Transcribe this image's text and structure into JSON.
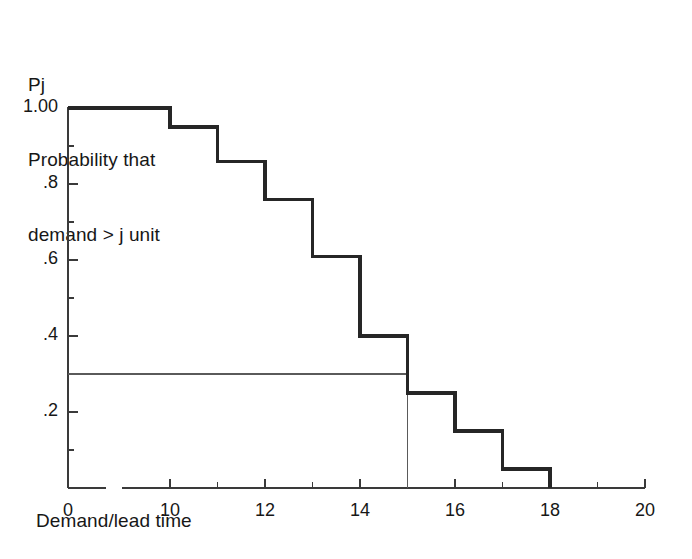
{
  "chart_data": {
    "type": "line",
    "subtype": "step-survival-function",
    "title": "",
    "ylabel": "Pj\nProbability that\ndemand > j unit",
    "ylabel_lines": [
      "Pj",
      "Probability that",
      "demand > j unit"
    ],
    "xlabel": "Demand/lead time",
    "x": [
      0,
      10,
      11,
      12,
      13,
      14,
      15,
      16,
      17,
      18
    ],
    "values": [
      1.0,
      0.95,
      0.86,
      0.76,
      0.61,
      0.4,
      0.25,
      0.15,
      0.05,
      0.0
    ],
    "steps": [
      {
        "x_start": 0,
        "x_end": 10,
        "p": 1.0
      },
      {
        "x_start": 10,
        "x_end": 11,
        "p": 0.95
      },
      {
        "x_start": 11,
        "x_end": 12,
        "p": 0.86
      },
      {
        "x_start": 12,
        "x_end": 13,
        "p": 0.76
      },
      {
        "x_start": 13,
        "x_end": 14,
        "p": 0.61
      },
      {
        "x_start": 14,
        "x_end": 15,
        "p": 0.4
      },
      {
        "x_start": 15,
        "x_end": 16,
        "p": 0.25
      },
      {
        "x_start": 16,
        "x_end": 17,
        "p": 0.15
      },
      {
        "x_start": 17,
        "x_end": 18,
        "p": 0.05
      }
    ],
    "reference_line": {
      "p": 0.3,
      "x_intersect": 15,
      "orientation": "horizontal-then-vertical"
    },
    "xlim": [
      0,
      20
    ],
    "ylim": [
      0,
      1.0
    ],
    "x_axis_break": {
      "after": 0,
      "before": 10
    },
    "xticks": [
      0,
      10,
      12,
      14,
      16,
      18,
      20
    ],
    "xtick_labels": [
      "0",
      "10",
      "12",
      "14",
      "16",
      "18",
      "20"
    ],
    "yticks": [
      1.0,
      0.8,
      0.6,
      0.4,
      0.2
    ],
    "ytick_labels": [
      "1.00",
      ".8",
      ".6",
      ".4",
      ".2"
    ],
    "yminor_step": 0.1,
    "grid": false,
    "legend": null,
    "colors": {
      "step_line": "#262626",
      "reference_line": "#5a5a5a",
      "axis": "#3a3a3a",
      "text": "#171717",
      "background": "#ffffff"
    }
  }
}
